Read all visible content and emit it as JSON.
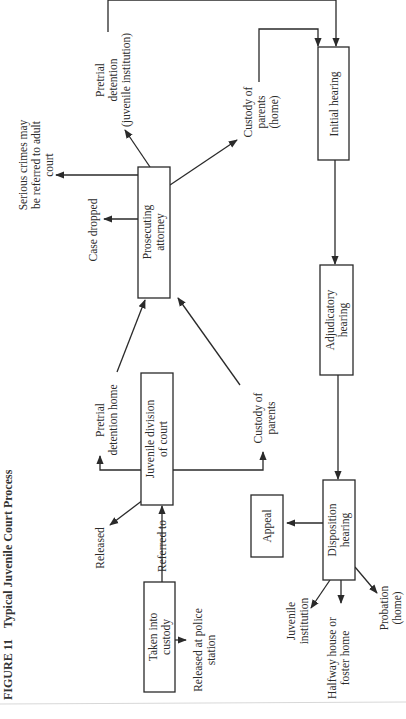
{
  "figure": {
    "number_label": "FIGURE 11",
    "title": "Typical Juvenile Court Process",
    "orientation": "rotated 90° counter-clockwise"
  },
  "nodes": {
    "taken_into_custody": {
      "line1": "Taken into",
      "line2": "custody"
    },
    "juvenile_division": {
      "line1": "Juvenile division",
      "line2": "of court"
    },
    "prosecuting_attorney": {
      "line1": "Prosecuting",
      "line2": "attorney"
    },
    "initial_hearing": {
      "line1": "Initial hearing"
    },
    "adjudicatory_hearing": {
      "line1": "Adjudicatory",
      "line2": "hearing"
    },
    "disposition_hearing": {
      "line1": "Disposition",
      "line2": "hearing"
    },
    "appeal": {
      "line1": "Appeal"
    }
  },
  "labels": {
    "released_at_police": {
      "line1": "Released at police",
      "line2": "station"
    },
    "referred_to": "Referred to",
    "released": "Released",
    "pretrial_detention_home": {
      "line1": "Pretrial",
      "line2": "detention home"
    },
    "custody_of_parents": {
      "line1": "Custody of",
      "line2": "parents"
    },
    "case_dropped": "Case dropped",
    "serious_crimes": {
      "line1": "Serious crimes may",
      "line2": "be referred to adult",
      "line3": "court"
    },
    "pretrial_detention_juvenile": {
      "line1": "Pretrial",
      "line2": "detention",
      "line3": "(juvenile institution)"
    },
    "custody_of_parents_home": {
      "line1": "Custody of",
      "line2": "parents",
      "line3": "(home)"
    },
    "juvenile_institution": {
      "line1": "Juvenile",
      "line2": "institution"
    },
    "halfway_house": {
      "line1": "Halfway house or",
      "line2": "foster home"
    },
    "probation": {
      "line1": "Probation",
      "line2": "(home)"
    }
  },
  "edges": [
    {
      "from": "taken_into_custody",
      "to": "released_at_police"
    },
    {
      "from": "taken_into_custody",
      "to": "juvenile_division",
      "label": "Referred to"
    },
    {
      "from": "juvenile_division",
      "to": "released"
    },
    {
      "from": "juvenile_division",
      "to": "pretrial_detention_home"
    },
    {
      "from": "juvenile_division",
      "to": "custody_of_parents"
    },
    {
      "from": "pretrial_detention_home",
      "to": "prosecuting_attorney"
    },
    {
      "from": "custody_of_parents",
      "to": "prosecuting_attorney"
    },
    {
      "from": "prosecuting_attorney",
      "to": "case_dropped"
    },
    {
      "from": "prosecuting_attorney",
      "to": "serious_crimes"
    },
    {
      "from": "prosecuting_attorney",
      "to": "pretrial_detention_juvenile"
    },
    {
      "from": "prosecuting_attorney",
      "to": "custody_of_parents_home"
    },
    {
      "from": "pretrial_detention_juvenile",
      "to": "initial_hearing"
    },
    {
      "from": "custody_of_parents_home",
      "to": "initial_hearing"
    },
    {
      "from": "initial_hearing",
      "to": "adjudicatory_hearing"
    },
    {
      "from": "adjudicatory_hearing",
      "to": "disposition_hearing"
    },
    {
      "from": "disposition_hearing",
      "to": "appeal"
    },
    {
      "from": "disposition_hearing",
      "to": "juvenile_institution"
    },
    {
      "from": "disposition_hearing",
      "to": "halfway_house"
    },
    {
      "from": "disposition_hearing",
      "to": "probation"
    }
  ]
}
